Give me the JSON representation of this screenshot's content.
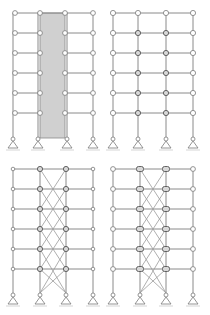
{
  "figure": {
    "colors": {
      "member": "#8a8a8a",
      "core_fill": "#d0d0d0",
      "node_fill": "#ffffff",
      "joint_fill": "#d8d8d8"
    },
    "panels": [
      {
        "id": "a",
        "type": "core-wall",
        "label": "Shear-wall core frame"
      },
      {
        "id": "b",
        "type": "rigid-frame",
        "label": "Moment-resisting frame"
      },
      {
        "id": "c",
        "type": "braced-frame",
        "label": "X-braced frame (pinned beams)"
      },
      {
        "id": "d",
        "type": "braced-frame-rigid",
        "label": "X-braced frame with rigid joints"
      }
    ],
    "storeys": 6,
    "bays": 3,
    "supports": "pinned (triangle) at each column base"
  }
}
